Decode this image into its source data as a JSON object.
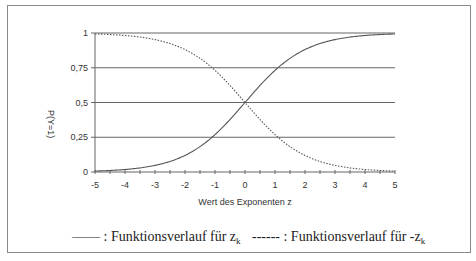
{
  "chart_data": {
    "type": "line",
    "title": "",
    "xlabel": "Wert des Exponenten z",
    "ylabel": "P(Y=1)",
    "xlim": [
      -5,
      5
    ],
    "ylim": [
      0,
      1
    ],
    "x_ticks": [
      "-5",
      "-4",
      "-3",
      "-2",
      "-1",
      "0",
      "1",
      "2",
      "3",
      "4",
      "5"
    ],
    "y_ticks": [
      "0",
      "0,25",
      "0,5",
      "0,75",
      "1"
    ],
    "grid": "horizontal",
    "x": [
      -5,
      -4,
      -3,
      -2,
      -1,
      0,
      1,
      2,
      3,
      4,
      5
    ],
    "series": [
      {
        "name": "Funktionsverlauf für z_k",
        "style": "solid",
        "values": [
          0.007,
          0.018,
          0.047,
          0.119,
          0.269,
          0.5,
          0.731,
          0.881,
          0.953,
          0.982,
          0.993
        ]
      },
      {
        "name": "Funktionsverlauf für -z_k",
        "style": "dotted",
        "values": [
          0.993,
          0.982,
          0.953,
          0.881,
          0.731,
          0.5,
          0.269,
          0.119,
          0.047,
          0.018,
          0.007
        ]
      }
    ],
    "legend_position": "bottom"
  },
  "legend": {
    "solid": {
      "symbol": "——",
      "text": " : Funktionsverlauf für z",
      "sub": "k"
    },
    "dotted": {
      "symbol": "------",
      "text": " : Funktionsverlauf für -z",
      "sub": "k"
    }
  },
  "colors": {
    "line": "#555555",
    "grid": "#666666",
    "text": "#333333"
  }
}
